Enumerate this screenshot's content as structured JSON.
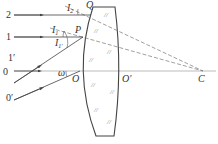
{
  "figure": {
    "type": "optics-lens-refraction-diagram",
    "colors": {
      "line": "#444444",
      "dashed": "#777777",
      "axis": "#999999",
      "text": "#333333"
    }
  },
  "labels": {
    "point_Q": "Q",
    "point_P": "P",
    "point_O": "O",
    "point_O_prime": "O′",
    "point_C": "C",
    "ray_2": "2",
    "ray_1": "1",
    "ray_1_prime": "1′",
    "ray_0": "0",
    "ray_0_prime": "0′",
    "angle_I2": "I",
    "angle_I2_sub": "2",
    "angle_I1": "I",
    "angle_I1_sub": "1",
    "angle_I1_prime": "I",
    "angle_I1_prime_sub": "1′",
    "angle_omega": "ω"
  },
  "elements": {
    "optical_axis": "horizontal line through O, O′, C",
    "lens": "meniscus-style lens with concave left surface and convex right surface",
    "rays": [
      "2 (parallel, hits Q)",
      "1 (parallel, hits P)",
      "1′ (oblique, hits P)",
      "0 (along axis)",
      "0′ (oblique, hits O)"
    ],
    "normals": [
      "Q→C dashed",
      "P→C dashed"
    ]
  }
}
